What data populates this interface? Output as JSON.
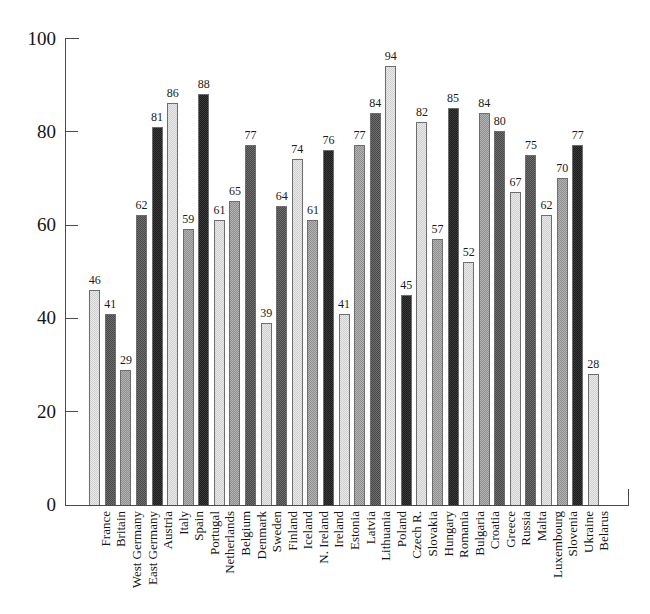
{
  "chart_data": {
    "type": "bar",
    "title": "",
    "xlabel": "",
    "ylabel": "",
    "ylim": [
      0,
      100
    ],
    "yticks": [
      0,
      20,
      40,
      60,
      80,
      100
    ],
    "grid": false,
    "legend": "none",
    "value_labels_shown": true,
    "categories": [
      "France",
      "Britain",
      "West Germany",
      "East Germany",
      "Austria",
      "Italy",
      "Spain",
      "Portugal",
      "Netherlands",
      "Belgium",
      "Denmark",
      "Sweden",
      "Finland",
      "Iceland",
      "N. Ireland",
      "Ireland",
      "Estonia",
      "Latvia",
      "Lithuania",
      "Poland",
      "Czech R.",
      "Slovakia",
      "Hungary",
      "Romania",
      "Bulgaria",
      "Croatia",
      "Greece",
      "Russia",
      "Malta",
      "Luxembourg",
      "Slovenia",
      "Ukraine",
      "Belarus"
    ],
    "values": [
      46,
      41,
      29,
      62,
      81,
      86,
      59,
      88,
      61,
      65,
      77,
      39,
      64,
      74,
      61,
      76,
      41,
      77,
      84,
      94,
      45,
      82,
      57,
      85,
      52,
      84,
      80,
      67,
      75,
      62,
      70,
      77,
      28
    ],
    "bar_shades": [
      "light",
      "dark",
      "mid",
      "dark",
      "black",
      "light",
      "mid",
      "black",
      "light",
      "mid",
      "dark",
      "light",
      "dark",
      "light",
      "mid",
      "black",
      "light",
      "mid",
      "dark",
      "light",
      "black",
      "light",
      "mid",
      "black",
      "light",
      "mid",
      "dark",
      "light",
      "dark",
      "light",
      "mid",
      "black",
      "light"
    ]
  },
  "axis": {
    "y_tick_labels": [
      "100",
      "80",
      "60",
      "40",
      "20",
      "0"
    ]
  }
}
